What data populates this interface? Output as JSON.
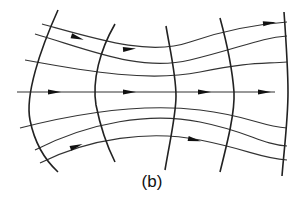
{
  "figure": {
    "label": "(b)",
    "colors": {
      "line": "#222222",
      "background": "#ffffff"
    },
    "rays": [
      {
        "id": "ray-top-1",
        "d": "M42,24 C100,40 150,56 190,42 S260,24 287,22",
        "arrow": [
          78,
          38
        ]
      },
      {
        "id": "ray-top-2",
        "d": "M35,34 C90,50 140,72 190,60 S260,38 287,36",
        "arrow": [
          197,
          48
        ]
      },
      {
        "id": "ray-top-3",
        "d": "M25,60 C90,72 150,82 200,72 S260,64 287,62",
        "arrow": [
          270,
          23
        ]
      },
      {
        "id": "ray-axis",
        "d": "M17,92 L275,92",
        "arrow": [
          55,
          92
        ]
      },
      {
        "id": "ray-bot-1",
        "d": "M20,128 C90,110 150,104 200,110 S260,126 287,128",
        "arrow": [
          130,
          92
        ]
      },
      {
        "id": "ray-bot-2",
        "d": "M35,150 C90,122 150,112 200,122 S260,144 287,146",
        "arrow": [
          205,
          92
        ]
      },
      {
        "id": "ray-bot-3",
        "d": "M40,163 C90,138 150,130 200,140 S260,158 287,160",
        "arrow": [
          265,
          92
        ]
      }
    ],
    "extra_arrows": [
      {
        "x": 77,
        "y": 146,
        "angle": -20
      },
      {
        "x": 195,
        "y": 140,
        "angle": 12
      }
    ],
    "wavefronts": [
      {
        "id": "front-1",
        "d": "M58,10 C40,50 25,95 30,120 C35,145 45,160 58,172"
      },
      {
        "id": "front-2",
        "d": "M115,24 C100,50 92,80 96,105 C100,125 108,148 115,162"
      },
      {
        "id": "front-3",
        "d": "M166,26 C170,50 176,75 176,96 C176,115 170,140 165,170"
      },
      {
        "id": "front-4",
        "d": "M220,18 C226,40 232,65 234,92 C235,112 228,140 220,172"
      },
      {
        "id": "front-5",
        "d": "M284,12 C286,40 288,70 288,92 C288,120 284,150 282,176"
      }
    ]
  }
}
